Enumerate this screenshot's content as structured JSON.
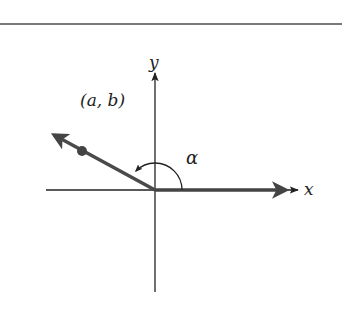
{
  "figure": {
    "axes": {
      "x_label": "x",
      "y_label": "y"
    },
    "vector": {
      "point_label": "(a, b)",
      "angle_label": "α"
    },
    "colors": {
      "axis": "#222222",
      "vector": "#4a4a4a",
      "rule": "#7a7a7a"
    }
  }
}
